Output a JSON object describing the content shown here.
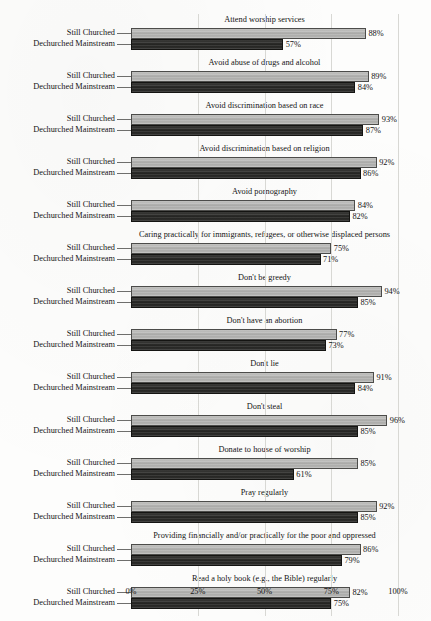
{
  "chart_data": {
    "type": "bar",
    "orientation": "horizontal",
    "title": "",
    "xlabel": "",
    "ylabel": "",
    "xlim": [
      0,
      100
    ],
    "x_tick_labels": [
      "0%",
      "25%",
      "50%",
      "75%",
      "100%"
    ],
    "x_tick_values": [
      0,
      25,
      50,
      75,
      100
    ],
    "grid": true,
    "grid_axis": "x",
    "legend": "none",
    "series_names": [
      "Still Churched",
      "Dechurched Mainstream"
    ],
    "series_colors": [
      "#b0b0ae",
      "#282826"
    ],
    "value_suffix": "%",
    "categories": [
      "Attend worship services",
      "Avoid abuse of drugs and alcohol",
      "Avoid discrimination based on race",
      "Avoid discrimination based on religion",
      "Avoid pornography",
      "Caring practically for immigrants, refugees, or otherwise displaced persons",
      "Don't be greedy",
      "Don't have an abortion",
      "Don't lie",
      "Don't steal",
      "Donate to house of worship",
      "Pray regularly",
      "Providing financially and/or practically for the poor and oppressed",
      "Read a holy book (e.g., the Bible) regularly"
    ],
    "series": [
      {
        "name": "Still Churched",
        "values": [
          88,
          89,
          93,
          92,
          84,
          75,
          94,
          77,
          91,
          96,
          85,
          92,
          86,
          82
        ]
      },
      {
        "name": "Dechurched Mainstream",
        "values": [
          57,
          84,
          87,
          86,
          82,
          71,
          85,
          73,
          84,
          85,
          61,
          85,
          79,
          75
        ]
      }
    ],
    "panels": [
      {
        "title": "Attend worship services",
        "bars": [
          {
            "series": "Still Churched",
            "value": 88,
            "label": "88%"
          },
          {
            "series": "Dechurched Mainstream",
            "value": 57,
            "label": "57%"
          }
        ]
      },
      {
        "title": "Avoid abuse of drugs and alcohol",
        "bars": [
          {
            "series": "Still Churched",
            "value": 89,
            "label": "89%"
          },
          {
            "series": "Dechurched Mainstream",
            "value": 84,
            "label": "84%"
          }
        ]
      },
      {
        "title": "Avoid discrimination based on race",
        "bars": [
          {
            "series": "Still Churched",
            "value": 93,
            "label": "93%"
          },
          {
            "series": "Dechurched Mainstream",
            "value": 87,
            "label": "87%"
          }
        ]
      },
      {
        "title": "Avoid discrimination based on religion",
        "bars": [
          {
            "series": "Still Churched",
            "value": 92,
            "label": "92%"
          },
          {
            "series": "Dechurched Mainstream",
            "value": 86,
            "label": "86%"
          }
        ]
      },
      {
        "title": "Avoid pornography",
        "bars": [
          {
            "series": "Still Churched",
            "value": 84,
            "label": "84%"
          },
          {
            "series": "Dechurched Mainstream",
            "value": 82,
            "label": "82%"
          }
        ]
      },
      {
        "title": "Caring practically for immigrants, refugees, or otherwise displaced persons",
        "bars": [
          {
            "series": "Still Churched",
            "value": 75,
            "label": "75%"
          },
          {
            "series": "Dechurched Mainstream",
            "value": 71,
            "label": "71%"
          }
        ]
      },
      {
        "title": "Don't be greedy",
        "bars": [
          {
            "series": "Still Churched",
            "value": 94,
            "label": "94%"
          },
          {
            "series": "Dechurched Mainstream",
            "value": 85,
            "label": "85%"
          }
        ]
      },
      {
        "title": "Don't have an abortion",
        "bars": [
          {
            "series": "Still Churched",
            "value": 77,
            "label": "77%"
          },
          {
            "series": "Dechurched Mainstream",
            "value": 73,
            "label": "73%"
          }
        ]
      },
      {
        "title": "Don't lie",
        "bars": [
          {
            "series": "Still Churched",
            "value": 91,
            "label": "91%"
          },
          {
            "series": "Dechurched Mainstream",
            "value": 84,
            "label": "84%"
          }
        ]
      },
      {
        "title": "Don't steal",
        "bars": [
          {
            "series": "Still Churched",
            "value": 96,
            "label": "96%"
          },
          {
            "series": "Dechurched Mainstream",
            "value": 85,
            "label": "85%"
          }
        ]
      },
      {
        "title": "Donate to house of worship",
        "bars": [
          {
            "series": "Still Churched",
            "value": 85,
            "label": "85%"
          },
          {
            "series": "Dechurched Mainstream",
            "value": 61,
            "label": "61%"
          }
        ]
      },
      {
        "title": "Pray regularly",
        "bars": [
          {
            "series": "Still Churched",
            "value": 92,
            "label": "92%"
          },
          {
            "series": "Dechurched Mainstream",
            "value": 85,
            "label": "85%"
          }
        ]
      },
      {
        "title": "Providing financially and/or practically for the poor and oppressed",
        "bars": [
          {
            "series": "Still Churched",
            "value": 86,
            "label": "86%"
          },
          {
            "series": "Dechurched Mainstream",
            "value": 79,
            "label": "79%"
          }
        ]
      },
      {
        "title": "Read a holy book (e.g., the Bible) regularly",
        "bars": [
          {
            "series": "Still Churched",
            "value": 82,
            "label": "82%"
          },
          {
            "series": "Dechurched Mainstream",
            "value": 75,
            "label": "75%"
          }
        ]
      }
    ]
  }
}
